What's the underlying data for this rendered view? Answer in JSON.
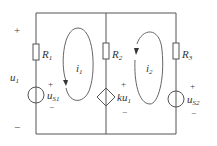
{
  "diagram": {
    "type": "circuit",
    "branches": [
      {
        "id": "left",
        "components": [
          "R1",
          "uS1"
        ]
      },
      {
        "id": "middle",
        "components": [
          "R2",
          "ku1"
        ]
      },
      {
        "id": "right",
        "components": [
          "R3",
          "uS2"
        ]
      }
    ],
    "labels": {
      "u1": "u",
      "u1_sub": "1",
      "plus": "+",
      "minus": "−",
      "R1": "R",
      "R1_sub": "1",
      "R2": "R",
      "R2_sub": "2",
      "R3": "R",
      "R3_sub": "3",
      "uS1": "u",
      "uS1_sub": "S1",
      "uS2": "u",
      "uS2_sub": "S2",
      "ku1": "ku",
      "ku1_sub": "1",
      "i1": "i",
      "i1_sub": "1",
      "i2": "i",
      "i2_sub": "2"
    },
    "mesh_currents": [
      {
        "name": "i1",
        "direction": "counterclockwise"
      },
      {
        "name": "i2",
        "direction": "counterclockwise"
      }
    ],
    "colors": {
      "wire": "#555555",
      "text": "#333333"
    }
  }
}
